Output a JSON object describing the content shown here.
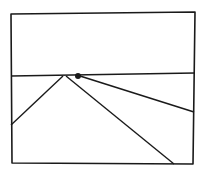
{
  "diagram": {
    "width": 203,
    "height": 174,
    "stroke_color": "#1a1a1a",
    "background": "#ffffff",
    "frame": {
      "points": [
        [
          11,
          14
        ],
        [
          195,
          12
        ],
        [
          193,
          164
        ],
        [
          12,
          163
        ]
      ]
    },
    "horizon_line": {
      "x1": 11,
      "y1": 76,
      "x2": 195,
      "y2": 73
    },
    "lines": [
      {
        "name": "left-diagonal",
        "x1": 63,
        "y1": 76,
        "x2": 11,
        "y2": 125
      },
      {
        "name": "center-diagonal",
        "x1": 66,
        "y1": 76,
        "x2": 174,
        "y2": 164
      },
      {
        "name": "right-diagonal",
        "x1": 80,
        "y1": 76,
        "x2": 194,
        "y2": 112
      }
    ],
    "point": {
      "cx": 78,
      "cy": 76,
      "r": 3
    }
  }
}
